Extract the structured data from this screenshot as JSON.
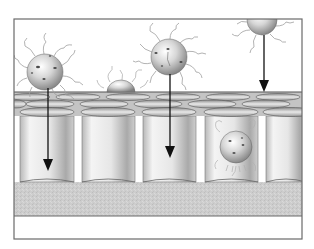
{
  "diagram": {
    "type": "illustration",
    "frame": {
      "x": 14,
      "y": 19,
      "width": 288,
      "height": 220,
      "stroke": "#6a6a6a"
    },
    "colors": {
      "background": "#ffffff",
      "frame": "#6a6a6a",
      "base_layer": "#cfcfcf",
      "membrane": "#bdbdbd",
      "cylinder_light": "#f2f2f2",
      "cylinder_dark": "#9a9a9a",
      "sphere_light": "#f4f4f4",
      "sphere_dark": "#8a8a8a",
      "arrow": "#111111",
      "ligand": "#9e9e9e"
    },
    "membrane": {
      "top_y": 92,
      "bottom_y": 116
    },
    "cylinders": [
      {
        "x": 20,
        "width": 54
      },
      {
        "x": 82,
        "width": 53
      },
      {
        "x": 143,
        "width": 53
      },
      {
        "x": 205,
        "width": 53
      },
      {
        "x": 266,
        "width": 36
      }
    ],
    "cylinder_top_y": 116,
    "cylinder_bottom_y": 182,
    "base_layer": {
      "top_y": 182,
      "bottom_y": 216
    },
    "particles": [
      {
        "name": "particle-left",
        "cx": 45,
        "cy": 72,
        "r": 18,
        "state": "binding at surface"
      },
      {
        "name": "particle-center",
        "cx": 169,
        "cy": 57,
        "r": 18,
        "state": "approaching"
      },
      {
        "name": "particle-right",
        "cx": 262,
        "cy": 20,
        "r": 15,
        "state": "approaching from top"
      },
      {
        "name": "particle-dome",
        "cx": 121,
        "cy": 94,
        "r": 14,
        "state": "fusing with membrane"
      },
      {
        "name": "particle-internalized",
        "cx": 236,
        "cy": 147,
        "r": 16,
        "state": "internalized in cell"
      }
    ],
    "arrows": [
      {
        "name": "arrow-left",
        "x": 48,
        "y1": 88,
        "y2": 170
      },
      {
        "name": "arrow-center",
        "x": 170,
        "y1": 74,
        "y2": 157
      },
      {
        "name": "arrow-right",
        "x": 264,
        "y1": 35,
        "y2": 92
      }
    ]
  }
}
